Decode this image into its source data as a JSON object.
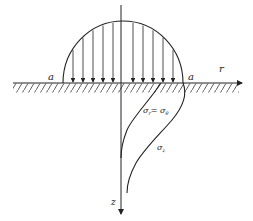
{
  "diagram": {
    "labels": {
      "a_left": "a",
      "a_right": "a",
      "r_axis": "r",
      "z_axis": "z",
      "sigma_r": "σ",
      "sigma_r_sub": "r",
      "sigma_eq": "= σ",
      "sigma_theta_sub": "θ",
      "sigma_z": "σ",
      "sigma_z_sub": "z"
    },
    "colors": {
      "line": "#222222",
      "background": "#ffffff"
    },
    "load_arrows_x": [
      73,
      83,
      93,
      103,
      113,
      133,
      143,
      153,
      163,
      173
    ]
  }
}
